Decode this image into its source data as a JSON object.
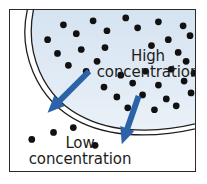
{
  "figure": {
    "type": "diagram",
    "frame": {
      "x": 9,
      "y": 9,
      "width": 187,
      "height": 163
    }
  },
  "labels": {
    "high": "High\nconcentration",
    "high_line1": "High",
    "high_line2": "concentration",
    "low": "Low\nconcentration",
    "low_line1": "Low",
    "low_line2": "concentration"
  },
  "colors": {
    "membrane_stroke": "#1d1d1b",
    "interior_fill_top": "#d4e2f0",
    "interior_fill_bottom": "#e9f0f8",
    "particle": "#111111",
    "arrow": "#2c63a8",
    "frame_border": "#2b2b2b",
    "background": "#ffffff",
    "text": "#1d1d1b"
  },
  "membrane": {
    "shape": "circular-arc",
    "stroke_style": "double-line",
    "outer_path": "M 19 -6 C 6 40 26 92 72 114 C 110 132 160 128 196 118",
    "inner_path": "M 25 -6 C 13 42 33 90 77 110 C 113 127 161 123 196 113",
    "fill_path": "M 25 -6 L 196 -6 L 196 113 C 161 123 113 127 77 110 C 33 90 13 42 25 -6 Z"
  },
  "particles": {
    "radius": 3.4,
    "high_region": [
      [
        54,
        15
      ],
      [
        84,
        11
      ],
      [
        117,
        8
      ],
      [
        150,
        12
      ],
      [
        175,
        16
      ],
      [
        38,
        30
      ],
      [
        67,
        24
      ],
      [
        98,
        21
      ],
      [
        129,
        18
      ],
      [
        160,
        30
      ],
      [
        182,
        26
      ],
      [
        48,
        44
      ],
      [
        72,
        40
      ],
      [
        96,
        38
      ],
      [
        143,
        36
      ],
      [
        170,
        43
      ],
      [
        59,
        56
      ],
      [
        88,
        52
      ],
      [
        178,
        52
      ],
      [
        77,
        62
      ],
      [
        112,
        66
      ],
      [
        137,
        62
      ],
      [
        163,
        60
      ],
      [
        186,
        64
      ],
      [
        95,
        78
      ],
      [
        124,
        74
      ],
      [
        150,
        76
      ],
      [
        176,
        72
      ],
      [
        108,
        88
      ],
      [
        134,
        86
      ],
      [
        158,
        90
      ],
      [
        183,
        84
      ],
      [
        119,
        99
      ],
      [
        146,
        101
      ],
      [
        168,
        97
      ]
    ],
    "low_region": [
      [
        22,
        131
      ],
      [
        44,
        124
      ],
      [
        64,
        119
      ],
      [
        86,
        137
      ]
    ]
  },
  "arrows": [
    {
      "name": "diffusion-arrow-left",
      "from": [
        80,
        62
      ],
      "to": [
        38,
        104
      ],
      "head_width": 15,
      "head_length": 17,
      "shaft_width": 6
    },
    {
      "name": "diffusion-arrow-right",
      "from": [
        130,
        87
      ],
      "to": [
        113,
        136
      ],
      "head_width": 15,
      "head_length": 17,
      "shaft_width": 6
    }
  ]
}
